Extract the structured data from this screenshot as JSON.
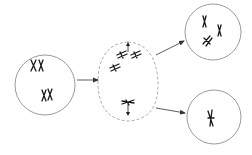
{
  "diagram": {
    "type": "cell-division-schematic",
    "stroke_color": "#707070",
    "chromosome_color": "#1a1a1a",
    "cells": [
      {
        "id": "parent-cell",
        "role": "parent",
        "chromosomes": 4
      },
      {
        "id": "dividing-cell",
        "role": "division-stage",
        "chromosomes": 4,
        "shape": "dashed-oval",
        "spindle_poles": 2
      },
      {
        "id": "daughter-cell-top",
        "role": "daughter",
        "chromosomes": 3
      },
      {
        "id": "daughter-cell-bottom",
        "role": "daughter",
        "chromosomes": 1
      }
    ],
    "arrows": [
      {
        "from": "parent-cell",
        "to": "dividing-cell"
      },
      {
        "from": "dividing-cell",
        "to": "daughter-cell-top"
      },
      {
        "from": "dividing-cell",
        "to": "daughter-cell-bottom"
      }
    ]
  }
}
